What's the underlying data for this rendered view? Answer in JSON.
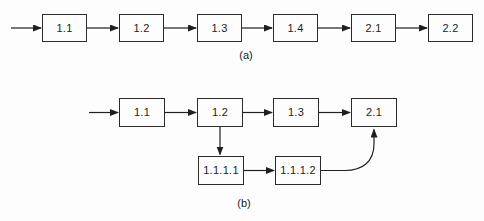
{
  "figure": {
    "colors": {
      "background": "#fdfdfd",
      "line": "#1f1f1f",
      "box_border": "#2b2b2b",
      "box_fill": "#fdfdfd",
      "text": "#1c1c1c"
    },
    "diagram_a": {
      "caption": "(a)",
      "boxes": [
        {
          "label": "1.1"
        },
        {
          "label": "1.2"
        },
        {
          "label": "1.3"
        },
        {
          "label": "1.4"
        },
        {
          "label": "2.1"
        },
        {
          "label": "2.2"
        }
      ],
      "edges": [
        "start→1.1",
        "1.1→1.2",
        "1.2→1.3",
        "1.3→1.4",
        "1.4→2.1",
        "2.1→2.2"
      ]
    },
    "diagram_b": {
      "caption": "(b)",
      "top_row_boxes": [
        {
          "label": "1.1"
        },
        {
          "label": "1.2"
        },
        {
          "label": "1.3"
        },
        {
          "label": "2.1"
        }
      ],
      "bottom_row_boxes": [
        {
          "label": "1.1.1.1"
        },
        {
          "label": "1.1.1.2"
        }
      ],
      "edges": [
        "start→1.1",
        "1.1→1.2",
        "1.2→1.3",
        "1.3→2.1",
        "1.2→1.1.1.1",
        "1.1.1.1→1.1.1.2",
        "1.1.1.2→2.1"
      ]
    }
  }
}
